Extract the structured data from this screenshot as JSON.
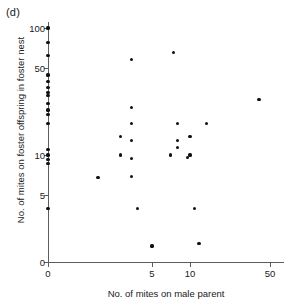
{
  "panel": {
    "label": "(d)"
  },
  "chart_data": {
    "type": "scatter",
    "title": "",
    "xlabel": "No. of mites on male parent",
    "ylabel": "No. of mites on foster offspring in foster nest",
    "xticks": [
      0,
      5,
      10,
      50
    ],
    "xtick_labels": [
      "0",
      "5",
      "10",
      "50"
    ],
    "yticks": [
      0,
      5,
      10,
      50,
      100
    ],
    "ytick_labels": [
      "0",
      "5",
      "10",
      "50",
      "100"
    ],
    "xscale": "symlog",
    "yscale": "symlog",
    "xlim": [
      0,
      55
    ],
    "ylim": [
      0,
      115
    ],
    "grid": false,
    "legend": null,
    "marker": "filled-circle",
    "marker_color": "#111111",
    "points": [
      {
        "x": 0,
        "y": 100
      },
      {
        "x": 0,
        "y": 78
      },
      {
        "x": 0,
        "y": 62
      },
      {
        "x": 0,
        "y": 44
      },
      {
        "x": 0,
        "y": 39
      },
      {
        "x": 0,
        "y": 35
      },
      {
        "x": 0,
        "y": 32
      },
      {
        "x": 0,
        "y": 30
      },
      {
        "x": 0,
        "y": 26
      },
      {
        "x": 0,
        "y": 23
      },
      {
        "x": 0,
        "y": 21
      },
      {
        "x": 0,
        "y": 18
      },
      {
        "x": 0,
        "y": 11
      },
      {
        "x": 0,
        "y": 10
      },
      {
        "x": 0,
        "y": 9.3
      },
      {
        "x": 0,
        "y": 8.6
      },
      {
        "x": 0,
        "y": 4
      },
      {
        "x": 2.4,
        "y": 6.8
      },
      {
        "x": 3.5,
        "y": 14
      },
      {
        "x": 3.5,
        "y": 10
      },
      {
        "x": 4,
        "y": 58
      },
      {
        "x": 4,
        "y": 24
      },
      {
        "x": 4,
        "y": 18
      },
      {
        "x": 4,
        "y": 13
      },
      {
        "x": 4,
        "y": 9.4
      },
      {
        "x": 4,
        "y": 6.9
      },
      {
        "x": 4.3,
        "y": 4
      },
      {
        "x": 5,
        "y": 1.2
      },
      {
        "x": 7,
        "y": 10
      },
      {
        "x": 7.4,
        "y": 65
      },
      {
        "x": 8,
        "y": 18
      },
      {
        "x": 8,
        "y": 13
      },
      {
        "x": 8,
        "y": 11.5
      },
      {
        "x": 9.5,
        "y": 9.6
      },
      {
        "x": 10,
        "y": 14
      },
      {
        "x": 10,
        "y": 10
      },
      {
        "x": 11,
        "y": 4
      },
      {
        "x": 12,
        "y": 1.4
      },
      {
        "x": 14,
        "y": 18
      },
      {
        "x": 40,
        "y": 28
      }
    ]
  }
}
